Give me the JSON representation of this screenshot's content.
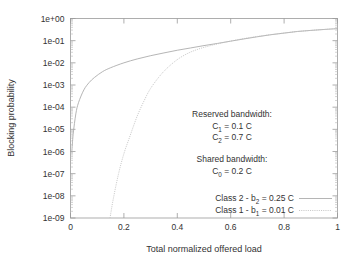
{
  "chart_data": {
    "type": "line",
    "title": "",
    "xlabel": "Total normalized offered load",
    "ylabel": "Blocking probability",
    "xlim": [
      0,
      1
    ],
    "ylim": [
      1e-09,
      1
    ],
    "yscale": "log",
    "xscale": "linear",
    "grid": false,
    "legend_position": "bottom-right-inside",
    "xticks": [
      "0",
      "0.2",
      "0.4",
      "0.6",
      "0.8",
      "1"
    ],
    "xtick_values": [
      0,
      0.2,
      0.4,
      0.6,
      0.8,
      1
    ],
    "yticks": [
      "1e+00",
      "1e-01",
      "1e-02",
      "1e-03",
      "1e-04",
      "1e-05",
      "1e-06",
      "1e-07",
      "1e-08",
      "1e-09"
    ],
    "ytick_values": [
      1,
      0.1,
      0.01,
      0.001,
      0.0001,
      1e-05,
      1e-06,
      1e-07,
      1e-08,
      1e-09
    ],
    "series": [
      {
        "name": "Class 2 - b2 = 0.25 C",
        "style": "solid",
        "color": "#a8a8a8",
        "x": [
          0.005,
          0.01,
          0.02,
          0.03,
          0.05,
          0.07,
          0.09,
          0.12,
          0.15,
          0.2,
          0.25,
          0.3,
          0.35,
          0.4,
          0.45,
          0.5,
          0.55,
          0.6,
          0.65,
          0.7,
          0.75,
          0.8,
          0.85,
          0.9,
          0.95,
          1.0
        ],
        "y": [
          1e-06,
          6e-06,
          5e-05,
          0.00016,
          0.0006,
          0.0013,
          0.0022,
          0.004,
          0.006,
          0.01,
          0.015,
          0.021,
          0.028,
          0.037,
          0.047,
          0.06,
          0.075,
          0.095,
          0.12,
          0.15,
          0.185,
          0.22,
          0.26,
          0.29,
          0.32,
          0.35
        ]
      },
      {
        "name": "Class 1 - b1 = 0.01 C",
        "style": "dotted",
        "color": "#c0c0c0",
        "x": [
          0.148,
          0.16,
          0.18,
          0.2,
          0.22,
          0.25,
          0.28,
          0.3,
          0.33,
          0.36,
          0.4,
          0.44,
          0.48,
          0.52,
          0.56,
          0.6,
          0.65,
          0.7,
          0.75,
          0.8,
          0.85,
          0.9,
          0.95,
          1.0
        ],
        "y": [
          1e-09,
          7e-09,
          1e-07,
          8e-07,
          4e-06,
          4e-05,
          0.00025,
          0.0007,
          0.0022,
          0.0055,
          0.014,
          0.027,
          0.042,
          0.058,
          0.076,
          0.096,
          0.125,
          0.155,
          0.187,
          0.22,
          0.26,
          0.29,
          0.32,
          0.35
        ]
      }
    ],
    "annotations": [
      {
        "id": "reserved-heading",
        "text": "Reserved bandwidth:"
      },
      {
        "id": "c1-value",
        "text": "C1 = 0.1 C"
      },
      {
        "id": "c2-value",
        "text": "C2 = 0.7 C"
      },
      {
        "id": "shared-heading",
        "text": "Shared bandwidth:"
      },
      {
        "id": "c0-value",
        "text": "C0 = 0.2 C"
      }
    ]
  },
  "axes": {
    "xlabel": "Total normalized offered load",
    "ylabel": "Blocking probability",
    "xticks": [
      "0",
      "0.2",
      "0.4",
      "0.6",
      "0.8",
      "1"
    ],
    "yticks": [
      "1e+00",
      "1e-01",
      "1e-02",
      "1e-03",
      "1e-04",
      "1e-05",
      "1e-06",
      "1e-07",
      "1e-08",
      "1e-09"
    ]
  },
  "annotations": {
    "reserved_heading": "Reserved bandwidth:",
    "c1_prefix": "C",
    "c1_subscript": "1",
    "c1_suffix": " = 0.1 C",
    "c2_prefix": "C",
    "c2_subscript": "2",
    "c2_suffix": " = 0.7 C",
    "shared_heading": "Shared bandwidth:",
    "c0_prefix": "C",
    "c0_subscript": "0",
    "c0_suffix": " = 0.2 C"
  },
  "legend": {
    "entries": [
      {
        "prefix": "Class 2 - b",
        "subscript": "2",
        "suffix": " = 0.25 C",
        "style": "solid"
      },
      {
        "prefix": "Class 1 - b",
        "subscript": "1",
        "suffix": " = 0.01 C",
        "style": "dotted"
      }
    ]
  },
  "colors": {
    "frame": "#9a9a9a",
    "series_class2": "#a8a8a8",
    "series_class1": "#c0c0c0",
    "background": "#ffffff",
    "text": "#333333"
  }
}
